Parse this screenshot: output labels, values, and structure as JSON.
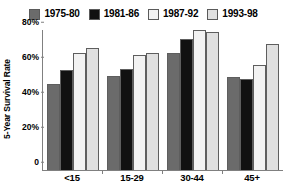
{
  "chart_data": {
    "type": "bar",
    "title": "",
    "xlabel": "",
    "ylabel": "5-Year Survival Rate",
    "categories": [
      "<15",
      "15-29",
      "30-44",
      "45+"
    ],
    "ylim": [
      0,
      80
    ],
    "yticks": [
      "0",
      "20%",
      "40%",
      "60%",
      "80%"
    ],
    "ytick_values": [
      0,
      20,
      40,
      60,
      80
    ],
    "grid": false,
    "legend_position": "top",
    "series": [
      {
        "name": "1975-80",
        "color": "#6b6b6b",
        "values": [
          49,
          54,
          67,
          53
        ]
      },
      {
        "name": "1981-86",
        "color": "#111111",
        "values": [
          57,
          58,
          75,
          52
        ]
      },
      {
        "name": "1987-92",
        "color": "#f2f2f2",
        "values": [
          67,
          66,
          80,
          60
        ]
      },
      {
        "name": "1993-98",
        "color": "#e0e0e0",
        "values": [
          70,
          67,
          79,
          72
        ]
      }
    ]
  }
}
